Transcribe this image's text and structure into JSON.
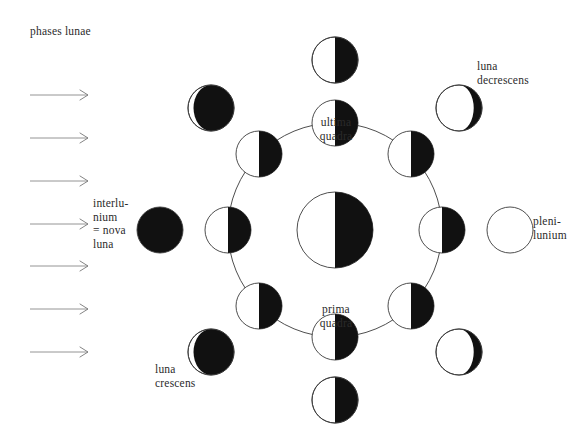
{
  "title": "phases lunae",
  "colors": {
    "lit": "#ffffff",
    "dark": "#111111",
    "stroke": "#3a3a3a",
    "text": "#2b2b2b",
    "background": "#ffffff"
  },
  "labels": {
    "interlunium": "interlu-\nnium\n= nova\nluna",
    "luna_decrescens": "luna\ndecrescens",
    "plenilunium": "pleni-\nlunium",
    "luna_crescens": "luna\ncrescens",
    "ultima_quadra": "ultima\nquadra",
    "prima_quadra": "prima\nquadra"
  },
  "sunlight_arrows": {
    "count": 7,
    "direction": "right",
    "x_start": 30,
    "x_end": 88,
    "y_values": [
      95,
      138,
      181,
      224,
      266,
      309,
      352
    ]
  },
  "chart_data": {
    "type": "diagram",
    "title": "phases lunae",
    "earth": {
      "label": "earth",
      "cx": 335,
      "cy": 230,
      "r": 38,
      "lit_side": "left",
      "dark_side": "right"
    },
    "orbit": {
      "cx": 335,
      "cy": 230,
      "r": 107,
      "stroke": "#3a3a3a"
    },
    "orbit_moons": [
      {
        "name": "orbit-moon-ultima-quadra",
        "angle_deg": 270,
        "cx": 335,
        "cy": 123,
        "r": 23,
        "lit_side": "left",
        "phase": "half"
      },
      {
        "name": "orbit-moon-upper-left",
        "angle_deg": 225,
        "cx": 259,
        "cy": 154,
        "r": 23,
        "lit_side": "left",
        "phase": "half"
      },
      {
        "name": "orbit-moon-interlunium",
        "angle_deg": 180,
        "cx": 228,
        "cy": 230,
        "r": 23,
        "lit_side": "left",
        "phase": "half"
      },
      {
        "name": "orbit-moon-lower-left",
        "angle_deg": 135,
        "cx": 259,
        "cy": 306,
        "r": 23,
        "lit_side": "left",
        "phase": "half"
      },
      {
        "name": "orbit-moon-prima-quadra",
        "angle_deg": 90,
        "cx": 335,
        "cy": 337,
        "r": 23,
        "lit_side": "left",
        "phase": "half"
      },
      {
        "name": "orbit-moon-lower-right",
        "angle_deg": 45,
        "cx": 411,
        "cy": 306,
        "r": 23,
        "lit_side": "left",
        "phase": "half"
      },
      {
        "name": "orbit-moon-plenilunium",
        "angle_deg": 0,
        "cx": 442,
        "cy": 230,
        "r": 23,
        "lit_side": "left",
        "phase": "half"
      },
      {
        "name": "orbit-moon-upper-right",
        "angle_deg": 315,
        "cx": 411,
        "cy": 154,
        "r": 23,
        "lit_side": "left",
        "phase": "half"
      }
    ],
    "appearance_moons": [
      {
        "name": "appearance-moon-ultima-quadra",
        "cx": 335,
        "cy": 60,
        "r": 23,
        "phase": "last-quarter",
        "illuminated": 0.5,
        "lit_side": "left"
      },
      {
        "name": "appearance-moon-waning-crescent",
        "cx": 211,
        "cy": 108,
        "r": 23,
        "phase": "waning-crescent",
        "illuminated": 0.12,
        "lit_side": "left"
      },
      {
        "name": "appearance-moon-interlunium",
        "cx": 160,
        "cy": 230,
        "r": 23,
        "phase": "new",
        "illuminated": 0.0,
        "lit_side": "none"
      },
      {
        "name": "appearance-moon-waxing-crescent",
        "cx": 211,
        "cy": 352,
        "r": 23,
        "phase": "waxing-crescent",
        "illuminated": 0.12,
        "lit_side": "left"
      },
      {
        "name": "appearance-moon-prima-quadra",
        "cx": 335,
        "cy": 400,
        "r": 23,
        "phase": "first-quarter",
        "illuminated": 0.5,
        "lit_side": "left"
      },
      {
        "name": "appearance-moon-waxing-gibbous",
        "cx": 459,
        "cy": 352,
        "r": 23,
        "phase": "waxing-gibbous",
        "illuminated": 0.82,
        "lit_side": "left"
      },
      {
        "name": "appearance-moon-plenilunium",
        "cx": 510,
        "cy": 230,
        "r": 23,
        "phase": "full",
        "illuminated": 1.0,
        "lit_side": "all"
      },
      {
        "name": "appearance-moon-waning-gibbous",
        "cx": 459,
        "cy": 108,
        "r": 23,
        "phase": "waning-gibbous",
        "illuminated": 0.82,
        "lit_side": "left"
      }
    ]
  }
}
